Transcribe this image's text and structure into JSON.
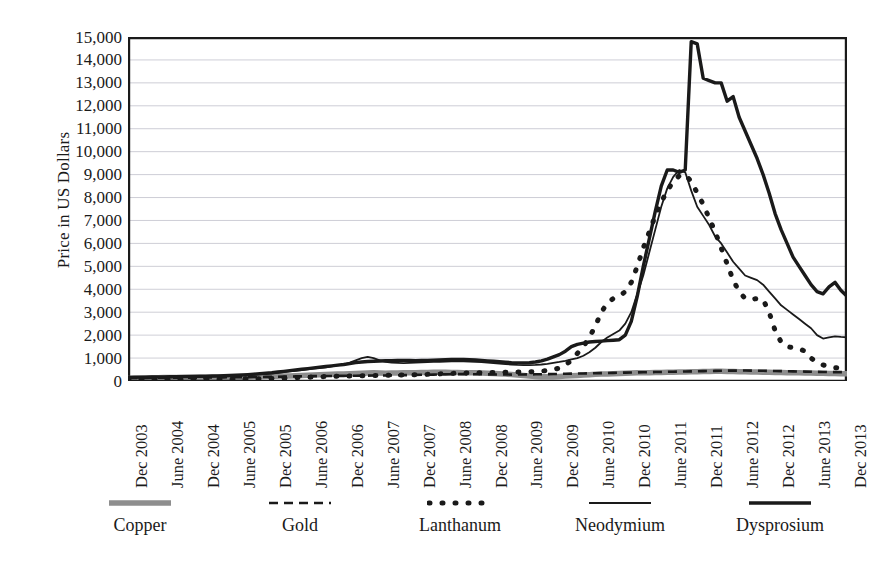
{
  "chart_data": {
    "type": "line",
    "title": "",
    "xlabel": "",
    "ylabel": "Price in US Dollars",
    "ylim": [
      0,
      15000
    ],
    "ytick_labels": [
      "0",
      "1,000",
      "2,000",
      "3,000",
      "4,000",
      "5,000",
      "6,000",
      "7,000",
      "8,000",
      "9,000",
      "10,000",
      "11,000",
      "12,000",
      "13,000",
      "14,000",
      "15,000"
    ],
    "ytick_values": [
      0,
      1000,
      2000,
      3000,
      4000,
      5000,
      6000,
      7000,
      8000,
      9000,
      10000,
      11000,
      12000,
      13000,
      14000,
      15000
    ],
    "grid": true,
    "legend_position": "bottom",
    "x_tick_labels": [
      "Dec 2003",
      "June 2004",
      "Dec 2004",
      "June 2005",
      "Dec 2005",
      "June 2006",
      "Dec 2006",
      "June 2007",
      "Dec 2007",
      "June 2008",
      "Dec 2008",
      "June 2009",
      "Dec 2009",
      "June 2010",
      "Dec 2010",
      "June 2011",
      "Dec 2011",
      "June 2012",
      "Dec 2012",
      "June 2013",
      "Dec 2013"
    ],
    "x_tick_step_months": 6,
    "x_start": "Dec 2003",
    "x_end": "Dec 2013",
    "x_points": 121,
    "series": [
      {
        "name": "Copper",
        "style": "solid-thick-gray",
        "color": "#8e8e8e",
        "width": 5.5,
        "dash": "none",
        "values": [
          105,
          110,
          120,
          130,
          140,
          145,
          150,
          155,
          150,
          145,
          150,
          160,
          155,
          150,
          155,
          160,
          165,
          160,
          155,
          160,
          170,
          180,
          190,
          200,
          205,
          210,
          215,
          220,
          230,
          240,
          250,
          260,
          270,
          280,
          290,
          300,
          310,
          320,
          330,
          340,
          350,
          360,
          350,
          340,
          345,
          350,
          355,
          360,
          365,
          370,
          375,
          380,
          385,
          380,
          375,
          370,
          365,
          360,
          355,
          350,
          340,
          330,
          320,
          300,
          280,
          260,
          240,
          220,
          200,
          190,
          185,
          190,
          200,
          215,
          230,
          245,
          260,
          275,
          290,
          300,
          310,
          320,
          330,
          340,
          350,
          355,
          360,
          365,
          370,
          375,
          380,
          385,
          390,
          395,
          400,
          405,
          410,
          415,
          420,
          420,
          415,
          410,
          405,
          400,
          395,
          390,
          385,
          380,
          375,
          370,
          365,
          360,
          355,
          350,
          345,
          340,
          335,
          330,
          325,
          320,
          320
        ]
      },
      {
        "name": "Gold",
        "style": "dashed",
        "color": "#1a1a1a",
        "width": 2.6,
        "dash": "9,6",
        "values": [
          130,
          133,
          135,
          138,
          140,
          142,
          140,
          138,
          140,
          143,
          145,
          148,
          150,
          152,
          155,
          157,
          160,
          162,
          165,
          168,
          170,
          173,
          175,
          178,
          180,
          185,
          190,
          195,
          200,
          205,
          210,
          212,
          215,
          218,
          220,
          222,
          225,
          228,
          230,
          233,
          236,
          238,
          240,
          243,
          246,
          250,
          255,
          260,
          265,
          270,
          275,
          280,
          285,
          290,
          295,
          300,
          300,
          298,
          295,
          292,
          290,
          288,
          285,
          283,
          280,
          282,
          285,
          288,
          292,
          296,
          300,
          305,
          310,
          315,
          320,
          325,
          330,
          335,
          340,
          345,
          350,
          355,
          360,
          365,
          370,
          375,
          380,
          385,
          390,
          395,
          400,
          405,
          410,
          415,
          420,
          425,
          430,
          435,
          440,
          445,
          450,
          452,
          455,
          455,
          452,
          450,
          445,
          440,
          435,
          430,
          425,
          420,
          415,
          410,
          405,
          400,
          395,
          390,
          388,
          386,
          385
        ]
      },
      {
        "name": "Lanthanum",
        "style": "dotted",
        "color": "#1a1a1a",
        "width": 5.0,
        "dash": "1,12",
        "values": [
          60,
          62,
          63,
          65,
          66,
          68,
          70,
          71,
          72,
          74,
          75,
          77,
          78,
          80,
          82,
          84,
          86,
          88,
          90,
          92,
          95,
          98,
          100,
          105,
          110,
          118,
          125,
          135,
          145,
          155,
          165,
          175,
          185,
          195,
          200,
          205,
          210,
          215,
          220,
          225,
          230,
          235,
          240,
          245,
          250,
          255,
          260,
          265,
          270,
          280,
          290,
          300,
          310,
          320,
          330,
          340,
          345,
          350,
          355,
          360,
          365,
          370,
          375,
          380,
          385,
          390,
          395,
          400,
          410,
          430,
          460,
          500,
          560,
          700,
          900,
          1200,
          1500,
          1900,
          2400,
          3000,
          3400,
          3600,
          3700,
          3900,
          4300,
          5000,
          5800,
          6500,
          7200,
          7800,
          8300,
          8700,
          8950,
          9000,
          8700,
          8200,
          7700,
          7100,
          6500,
          5800,
          5100,
          4400,
          3900,
          3600,
          3550,
          3600,
          3550,
          3000,
          2200,
          1700,
          1500,
          1450,
          1400,
          1300,
          1000,
          800,
          700,
          620,
          580,
          560,
          550
        ]
      },
      {
        "name": "Neodymium",
        "style": "solid-thin",
        "color": "#1a1a1a",
        "width": 1.8,
        "dash": "none",
        "values": [
          140,
          143,
          146,
          150,
          153,
          156,
          160,
          163,
          166,
          170,
          173,
          176,
          180,
          185,
          190,
          195,
          200,
          210,
          220,
          235,
          250,
          270,
          290,
          310,
          330,
          360,
          390,
          420,
          450,
          480,
          510,
          540,
          570,
          600,
          640,
          680,
          720,
          800,
          900,
          1000,
          1050,
          1000,
          900,
          830,
          800,
          790,
          780,
          790,
          800,
          810,
          820,
          830,
          840,
          850,
          855,
          860,
          860,
          850,
          840,
          820,
          800,
          780,
          760,
          740,
          720,
          700,
          690,
          690,
          700,
          720,
          750,
          790,
          830,
          880,
          940,
          1000,
          1100,
          1250,
          1450,
          1700,
          1900,
          2050,
          2200,
          2500,
          3000,
          3800,
          4600,
          5600,
          6600,
          7600,
          8400,
          8900,
          9200,
          9100,
          8300,
          7600,
          7200,
          6800,
          6300,
          6000,
          5600,
          5200,
          4900,
          4600,
          4500,
          4400,
          4200,
          3900,
          3600,
          3300,
          3100,
          2900,
          2700,
          2500,
          2300,
          2000,
          1850,
          1900,
          1950,
          1920,
          1900
        ]
      },
      {
        "name": "Dysprosium",
        "style": "solid-thick",
        "color": "#1a1a1a",
        "width": 3.4,
        "dash": "none",
        "values": [
          160,
          163,
          167,
          170,
          174,
          178,
          182,
          186,
          190,
          194,
          198,
          202,
          206,
          212,
          218,
          224,
          230,
          240,
          250,
          265,
          280,
          300,
          320,
          340,
          360,
          390,
          420,
          450,
          480,
          510,
          540,
          570,
          600,
          630,
          660,
          690,
          720,
          760,
          800,
          830,
          850,
          860,
          870,
          880,
          890,
          900,
          900,
          895,
          890,
          895,
          900,
          910,
          920,
          930,
          935,
          940,
          940,
          930,
          920,
          900,
          880,
          860,
          840,
          820,
          800,
          790,
          790,
          800,
          830,
          880,
          950,
          1050,
          1150,
          1300,
          1500,
          1600,
          1650,
          1700,
          1720,
          1740,
          1760,
          1780,
          1800,
          2000,
          2600,
          3700,
          5000,
          6200,
          7400,
          8500,
          9200,
          9200,
          9100,
          9200,
          14800,
          14700,
          13200,
          13100,
          13000,
          13000,
          12200,
          12400,
          11500,
          10900,
          10300,
          9700,
          9000,
          8200,
          7300,
          6600,
          6000,
          5400,
          5000,
          4600,
          4200,
          3900,
          3800,
          4100,
          4300,
          3950,
          3700
        ]
      }
    ]
  },
  "legend": {
    "items": [
      {
        "label": "Copper"
      },
      {
        "label": "Gold"
      },
      {
        "label": "Lanthanum"
      },
      {
        "label": "Neodymium"
      },
      {
        "label": "Dysprosium"
      }
    ]
  }
}
